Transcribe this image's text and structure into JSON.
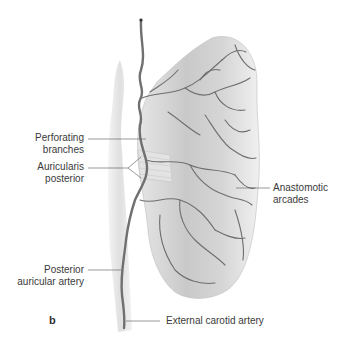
{
  "figure": {
    "panel_letter": "b",
    "labels": {
      "perforating_1": "Perforating",
      "perforating_2": "branches",
      "auricularis_1": "Auricularis",
      "auricularis_2": "posterior",
      "anastomotic_1": "Anastomotic",
      "anastomotic_2": "arcades",
      "posterior_1": "Posterior",
      "posterior_2": "auricular artery",
      "external": "External carotid artery"
    },
    "colors": {
      "ear_fill": "#d9d9d9",
      "vessel": "#6e6e6e",
      "leader": "#555555",
      "text": "#3a3a3a"
    }
  }
}
